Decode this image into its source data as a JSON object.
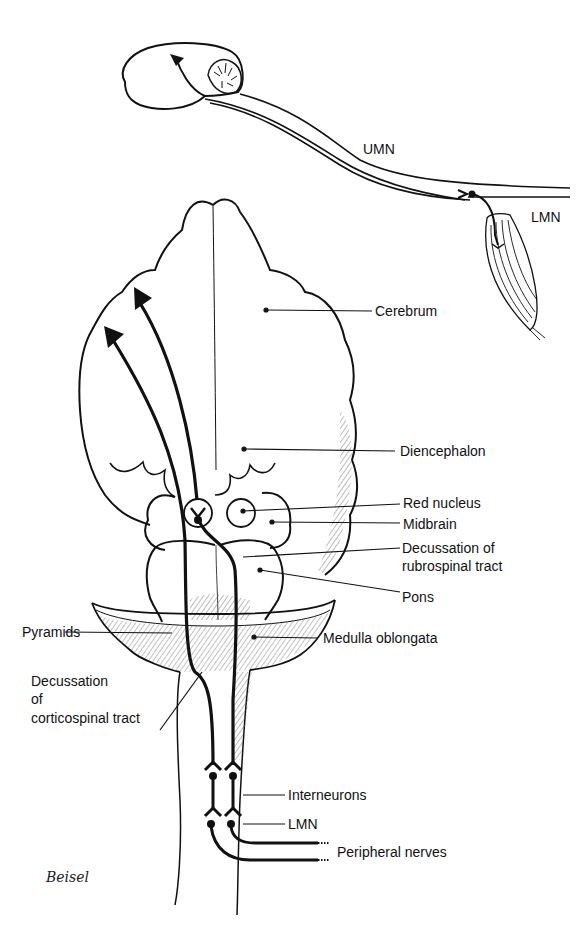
{
  "figure": {
    "colors": {
      "ink": "#111111",
      "background": "#ffffff",
      "hatch": "#555555"
    },
    "top_inset": {
      "labels": {
        "umn": "UMN",
        "lmn": "LMN"
      }
    },
    "main": {
      "labels": {
        "cerebrum": "Cerebrum",
        "diencephalon": "Diencephalon",
        "red_nucleus": "Red nucleus",
        "midbrain": "Midbrain",
        "decussation_rubrospinal_line1": "Decussation of",
        "decussation_rubrospinal_line2": "rubrospinal tract",
        "pons": "Pons",
        "pyramids": "Pyramids",
        "medulla_oblongata": "Medulla oblongata",
        "decussation_corticospinal_line1": "Decussation",
        "decussation_corticospinal_line2": "of",
        "decussation_corticospinal_line3": "corticospinal tract",
        "interneurons": "Interneurons",
        "lmn": "LMN",
        "peripheral_nerves": "Peripheral nerves"
      }
    },
    "signature": "Beisel"
  }
}
